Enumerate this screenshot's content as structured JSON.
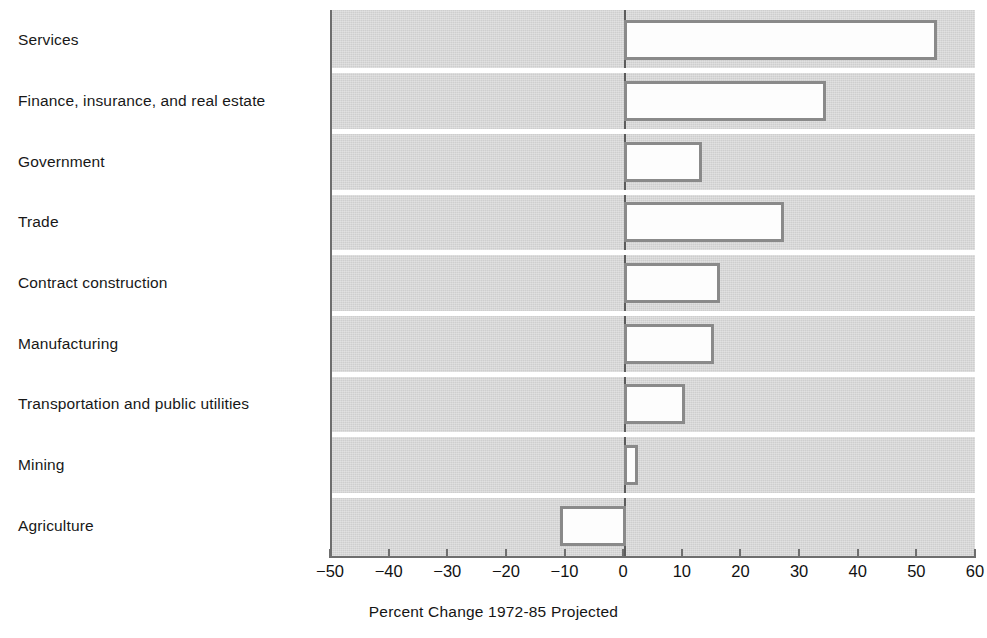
{
  "chart_data": {
    "type": "bar",
    "orientation": "horizontal",
    "title": "",
    "xlabel": "Percent Change 1972-85 Projected",
    "ylabel": "",
    "xlim": [
      -50,
      60
    ],
    "xticks": [
      -50,
      -40,
      -30,
      -20,
      -10,
      0,
      10,
      20,
      30,
      40,
      50,
      60
    ],
    "xtick_labels": [
      "−50",
      "−40",
      "−30",
      "−20",
      "−10",
      "0",
      "10",
      "20",
      "30",
      "40",
      "50",
      "60"
    ],
    "grid": false,
    "legend": false,
    "categories": [
      "Services",
      "Finance, insurance, and real estate",
      "Government",
      "Trade",
      "Contract construction",
      "Manufacturing",
      "Transportation and public utilities",
      "Mining",
      "Agriculture"
    ],
    "values": [
      53,
      34,
      13,
      27,
      16,
      15,
      10,
      2,
      -11
    ],
    "series": [
      {
        "name": "Percent Change 1972-85 Projected",
        "values": [
          53,
          34,
          13,
          27,
          16,
          15,
          10,
          2,
          -11
        ]
      }
    ],
    "colors": {
      "plot_background": "#d3d3d3",
      "bar_fill": "#fdfdfd",
      "bar_border": "#8a8a8a",
      "axis": "#6e6e6e",
      "separator": "#ffffff",
      "text": "#151515"
    }
  },
  "axis": {
    "title": "Percent Change 1972-85 Projected"
  }
}
